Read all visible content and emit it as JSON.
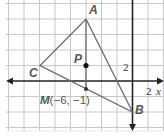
{
  "diagram": {
    "type": "coordinate-geometry",
    "grid_unit": 2,
    "axes": {
      "x_label": "x",
      "x_tick_label": "2",
      "y_tick_label": "2"
    },
    "vertices": [
      {
        "name": "A",
        "label": "A",
        "x": -6,
        "y": 8
      },
      {
        "name": "B",
        "label": "B",
        "x": 0,
        "y": -4
      },
      {
        "name": "C",
        "label": "C",
        "x": -12,
        "y": 2
      }
    ],
    "points": [
      {
        "name": "P",
        "label": "P",
        "x": -6,
        "y": 2
      },
      {
        "name": "M",
        "label": "M(−6, −1)",
        "x": -6,
        "y": -1
      }
    ],
    "segments": [
      "AB",
      "BC",
      "CA",
      "AM"
    ],
    "colors": {
      "grid": "#c8c8c8",
      "axis": "#222222",
      "triangle": "#6a6a6a",
      "point": "#111111"
    }
  }
}
